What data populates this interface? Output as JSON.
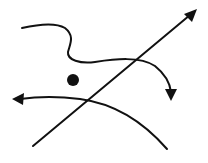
{
  "diagram": {
    "background": "#ffffff",
    "stroke_color": "#111111",
    "elements": [
      {
        "id": "straight-arrow",
        "kind": "arrow",
        "shape": "straight",
        "direction": "up-right"
      },
      {
        "id": "wavy-arrow",
        "kind": "arrow",
        "shape": "wavy-curve",
        "direction": "down"
      },
      {
        "id": "curved-arrow",
        "kind": "arrow",
        "shape": "arc",
        "direction": "left"
      },
      {
        "id": "dot",
        "kind": "point",
        "shape": "filled-circle"
      }
    ]
  }
}
